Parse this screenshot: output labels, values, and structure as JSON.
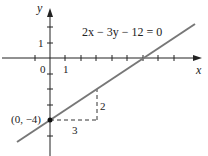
{
  "diagram": {
    "equation": "2x − 3y − 12 = 0",
    "axes": {
      "x_label": "x",
      "y_label": "y"
    },
    "tick_labels": {
      "origin": "0",
      "x_one": "1",
      "y_one": "1"
    },
    "point_label": "(0, −4)",
    "run_label": "3",
    "rise_label": "2",
    "colors": {
      "line": "#777777",
      "axis": "#222222",
      "dash": "#333333"
    }
  }
}
